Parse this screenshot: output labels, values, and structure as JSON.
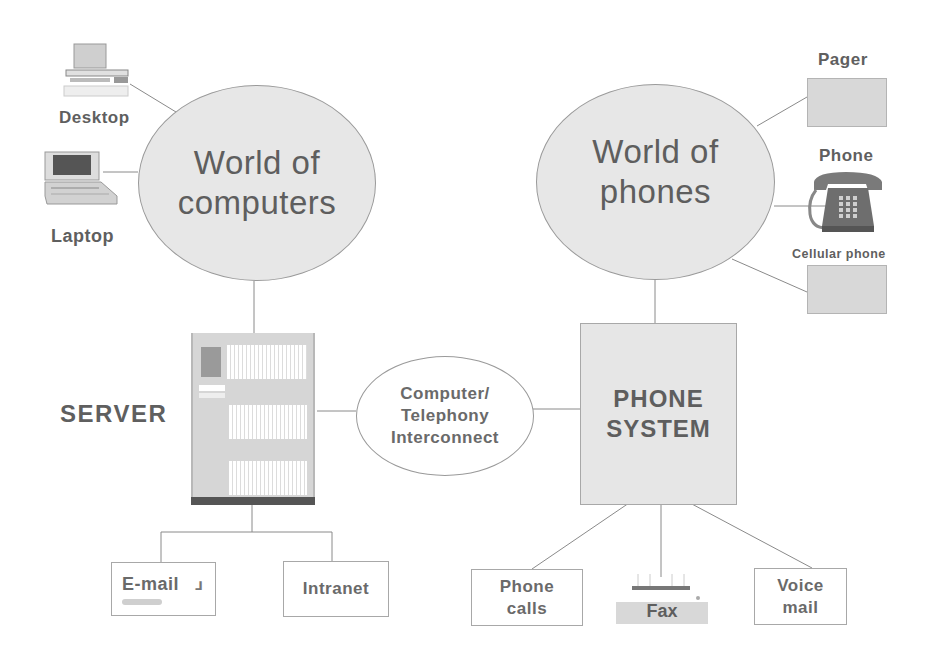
{
  "diagram": {
    "type": "network-diagram",
    "left_cluster": {
      "hub": {
        "line1": "World of",
        "line2": "computers"
      },
      "devices": [
        {
          "label": "Desktop",
          "icon": "desktop-computer-icon"
        },
        {
          "label": "Laptop",
          "icon": "laptop-icon"
        }
      ],
      "server_label": "SERVER",
      "server_icon": "server-cabinet-icon",
      "services": [
        {
          "label": "E-mail",
          "icon": "email-icon"
        },
        {
          "label": "Intranet"
        }
      ]
    },
    "interconnect": {
      "line1": "Computer/",
      "line2": "Telephony",
      "line3": "Interconnect"
    },
    "right_cluster": {
      "hub": {
        "line1": "World of",
        "line2": "phones"
      },
      "devices": [
        {
          "label": "Pager",
          "icon": "pager-placeholder"
        },
        {
          "label": "Phone",
          "icon": "desk-telephone-icon"
        },
        {
          "label": "Cellular phone",
          "icon": "cellular-placeholder"
        }
      ],
      "phone_system": {
        "line1": "PHONE",
        "line2": "SYSTEM"
      },
      "services": [
        {
          "line1": "Phone",
          "line2": "calls"
        },
        {
          "line1": "Fax",
          "icon": "fax-machine-icon"
        },
        {
          "line1": "Voice",
          "line2": "mail"
        }
      ]
    },
    "colors": {
      "ellipse_fill": "#e7e7e7",
      "line": "#8a8a8a",
      "text": "#5e5e5e",
      "server_base": "#555555"
    }
  }
}
